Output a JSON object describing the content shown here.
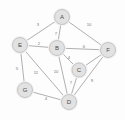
{
  "diagram": {
    "type": "graph",
    "node_fill": "#e2e2e2",
    "node_stroke": "#b4b4b4",
    "edge_color": "#8e8e8e",
    "label_color": "#4a4a4a",
    "weight_color": "#777777",
    "background": "#fdfdfd",
    "nodes": [
      {
        "id": "A",
        "label": "A",
        "x": 62,
        "y": 17,
        "r": 7.5
      },
      {
        "id": "B",
        "label": "B",
        "x": 57,
        "y": 48,
        "r": 7.5
      },
      {
        "id": "C",
        "label": "C",
        "x": 79,
        "y": 70,
        "r": 7.0
      },
      {
        "id": "D",
        "label": "D",
        "x": 69,
        "y": 102,
        "r": 7.5
      },
      {
        "id": "E",
        "label": "E",
        "x": 20,
        "y": 45,
        "r": 7.5
      },
      {
        "id": "F",
        "label": "F",
        "x": 108,
        "y": 50,
        "r": 7.5
      },
      {
        "id": "G",
        "label": "G",
        "x": 25,
        "y": 90,
        "r": 7.5
      }
    ],
    "edges": [
      {
        "from": "A",
        "to": "E",
        "weight": "3",
        "lx": 38,
        "ly": 24
      },
      {
        "from": "A",
        "to": "B",
        "weight": "7",
        "lx": 56,
        "ly": 33
      },
      {
        "from": "A",
        "to": "F",
        "weight": "10",
        "lx": 89,
        "ly": 24
      },
      {
        "from": "E",
        "to": "B",
        "weight": "2",
        "lx": 39,
        "ly": 43
      },
      {
        "from": "B",
        "to": "F",
        "weight": "6",
        "lx": 84,
        "ly": 46
      },
      {
        "from": "B",
        "to": "C",
        "weight": "4",
        "lx": 69,
        "ly": 57
      },
      {
        "from": "B",
        "to": "D",
        "weight": "10",
        "lx": 56,
        "ly": 71
      },
      {
        "from": "E",
        "to": "G",
        "weight": "5",
        "lx": 17,
        "ly": 68
      },
      {
        "from": "E",
        "to": "D",
        "weight": "11",
        "lx": 36,
        "ly": 72
      },
      {
        "from": "C",
        "to": "D",
        "weight": "7",
        "lx": 71,
        "ly": 82
      },
      {
        "from": "C",
        "to": "F",
        "weight": "",
        "lx": 0,
        "ly": 0
      },
      {
        "from": "D",
        "to": "F",
        "weight": "9",
        "lx": 92,
        "ly": 80
      },
      {
        "from": "G",
        "to": "D",
        "weight": "4",
        "lx": 46,
        "ly": 98
      }
    ]
  }
}
